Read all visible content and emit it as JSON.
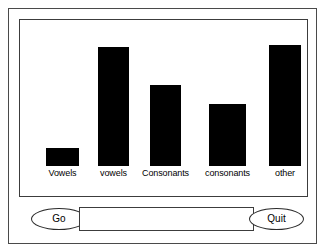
{
  "window": {
    "title": "Letter Frequency",
    "background_color": "#ffffff",
    "frame_color": "#4a4a4a"
  },
  "chart_panel": {
    "border_color": "#3c3c3c"
  },
  "chart_data": {
    "type": "bar",
    "title": "",
    "subtitle": "",
    "xlabel": "",
    "ylabel": "",
    "grid": false,
    "legend": "none",
    "bar_color": "#000000",
    "categories": [
      "Vowels",
      "vowels",
      "Consonants",
      "consonants",
      "other"
    ],
    "values": [
      15,
      102,
      69,
      53,
      104
    ],
    "ylim": [
      0,
      125
    ],
    "tick_labels": [
      "Vowels",
      "vowels",
      "Consonants",
      "consonants",
      "other"
    ]
  },
  "controls": {
    "go_label": "Go",
    "quit_label": "Quit",
    "input_value": "",
    "input_placeholder": ""
  }
}
